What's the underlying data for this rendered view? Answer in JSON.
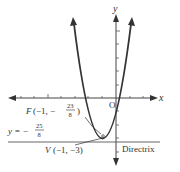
{
  "axes": {
    "x_label": "x",
    "y_label": "y",
    "origin_label": "O"
  },
  "focus": {
    "letter": "F",
    "coords_prefix": "(−1, −",
    "frac_num": "23",
    "frac_den": "8",
    "coords_suffix": ")"
  },
  "directrix_eq": {
    "prefix": "y = −",
    "frac_num": "25",
    "frac_den": "8"
  },
  "vertex": {
    "letter": "V",
    "coords": "(−1, −3)"
  },
  "directrix_label": "Directrix",
  "colors": {
    "curve": "#333333",
    "axis": "#333333",
    "text": "#333333"
  }
}
